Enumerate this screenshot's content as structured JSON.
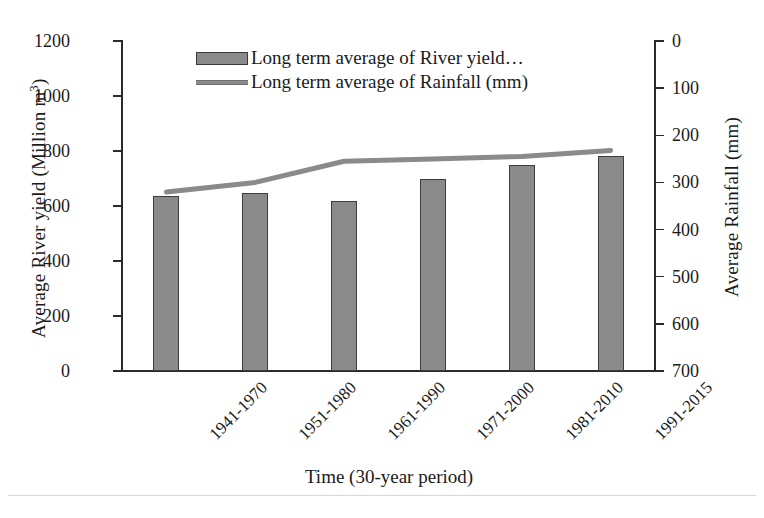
{
  "chart_data": {
    "type": "bar",
    "title": "",
    "xlabel": "Time (30-year period)",
    "ylabel": "Average River yield (Million m³)",
    "ylabel_right": "Average Rainfall (mm)",
    "categories": [
      "1941-1970",
      "1951-1980",
      "1961-1990",
      "1971-2000",
      "1981-2010",
      "1991-2015"
    ],
    "series": [
      {
        "name": "Long term average of River yield…",
        "type": "bar",
        "axis": "left",
        "unit": "Million m³",
        "values": [
          636,
          647,
          618,
          698,
          749,
          782
        ]
      },
      {
        "name": "Long term average of Rainfall (mm)",
        "type": "line",
        "axis": "right",
        "unit": "mm",
        "values": [
          320,
          300,
          255,
          250,
          245,
          232
        ]
      }
    ],
    "ylim": [
      0,
      1200
    ],
    "ylim_right": [
      700,
      0
    ],
    "y_ticks": [
      0,
      200,
      400,
      600,
      800,
      1000,
      1200
    ],
    "y_ticks_right": [
      0,
      100,
      200,
      300,
      400,
      500,
      600,
      700
    ],
    "right_axis_inverted": true,
    "grid": false,
    "legend_position": "top-center",
    "colors": {
      "bar_fill": "#8a8a8a",
      "bar_border": "#3d3d3d",
      "line": "#8a8a8a",
      "axis": "#2b2b2b",
      "text": "#1a1a1a",
      "background": "#ffffff"
    }
  },
  "axes": {
    "left": {
      "title": "Average River yield (Million m",
      "title_sup": "3",
      "title_tail": ")",
      "tick_labels": [
        "1200",
        "1000",
        "800",
        "600",
        "400",
        "200",
        "0"
      ]
    },
    "right": {
      "title": "Average Rainfall (mm)",
      "tick_labels": [
        "0",
        "100",
        "200",
        "300",
        "400",
        "500",
        "600",
        "700"
      ]
    },
    "bottom": {
      "title": "Time (30-year period)",
      "tick_labels": [
        "1941-1970",
        "1951-1980",
        "1961-1990",
        "1971-2000",
        "1981-2010",
        "1991-2015"
      ]
    }
  },
  "legend": {
    "items": [
      {
        "label": "Long term average of River yield…",
        "marker": "bar-swatch"
      },
      {
        "label": "Long term average of Rainfall (mm)",
        "marker": "line-swatch"
      }
    ]
  }
}
